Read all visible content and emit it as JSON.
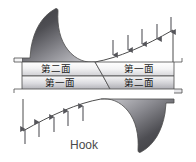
{
  "figure": {
    "caption": "Hook",
    "background_color": "#ffffff",
    "outline_color": "#4d4d4d",
    "labels": {
      "left_upper_band": "第二面",
      "left_lower_band": "第一面",
      "right_upper_band": "第一面",
      "right_lower_band": "第二面"
    },
    "arrows": {
      "top_direction": "down",
      "top_count": 5,
      "bottom_direction": "up",
      "bottom_count": 5,
      "color": "#55555a"
    },
    "surfaces": {
      "upper_left_shape": "hyperbolic-dark-wedge",
      "lower_right_shape": "hyperbolic-dark-wedge",
      "dark_fill_start": "#2f2f33",
      "dark_fill_end": "#b9b9bd",
      "band_fill_start": "#fdfdfd",
      "band_fill_end": "#bdbdc2"
    }
  }
}
